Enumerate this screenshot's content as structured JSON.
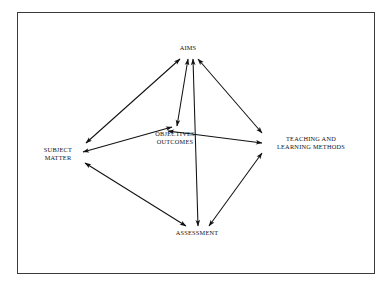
{
  "figure": {
    "type": "relationship-diagram",
    "frame": {
      "border_color": "#3b3b3f",
      "background": "#ffffff"
    },
    "line_color": "#111114"
  },
  "nodes": [
    {
      "id": "aims",
      "label": "AIMS",
      "x": 188,
      "y": 48
    },
    {
      "id": "subject",
      "label": "SUBJECT\nMATTER",
      "x": 58,
      "y": 154
    },
    {
      "id": "objectives",
      "label": "OBJECTIVES\nOUTCOMES",
      "x": 175,
      "y": 138
    },
    {
      "id": "teaching",
      "label": "TEACHING AND\nLEARNING METHODS",
      "x": 311,
      "y": 143
    },
    {
      "id": "assessment",
      "label": "ASSESSMENT",
      "x": 197,
      "y": 233
    }
  ],
  "edges": [
    {
      "id": "aims-subject",
      "from": "aims",
      "to": "subject",
      "direction": "both"
    },
    {
      "id": "aims-teaching",
      "from": "aims",
      "to": "teaching",
      "direction": "both"
    },
    {
      "id": "aims-objectives",
      "from": "aims",
      "to": "objectives",
      "direction": "both"
    },
    {
      "id": "aims-assessment",
      "from": "aims",
      "to": "assessment",
      "direction": "both"
    },
    {
      "id": "subject-objectives",
      "from": "subject",
      "to": "objectives",
      "direction": "both"
    },
    {
      "id": "subject-assessment",
      "from": "subject",
      "to": "assessment",
      "direction": "both"
    },
    {
      "id": "objectives-teaching",
      "from": "objectives",
      "to": "teaching",
      "direction": "both"
    },
    {
      "id": "teaching-assessment",
      "from": "teaching",
      "to": "assessment",
      "direction": "both"
    }
  ],
  "edge_geometry": {
    "aims-subject": {
      "x1": 180,
      "y1": 59,
      "x2": 86,
      "y2": 143
    },
    "aims-teaching": {
      "x1": 198,
      "y1": 59,
      "x2": 262,
      "y2": 133
    },
    "aims-objectives": {
      "x1": 188,
      "y1": 59,
      "x2": 177,
      "y2": 126
    },
    "aims-assessment": {
      "x1": 193,
      "y1": 59,
      "x2": 198,
      "y2": 226
    },
    "subject-objectives": {
      "x1": 83,
      "y1": 152,
      "x2": 172,
      "y2": 127
    },
    "subject-assessment": {
      "x1": 85,
      "y1": 163,
      "x2": 186,
      "y2": 226
    },
    "objectives-teaching": {
      "x1": 168,
      "y1": 131,
      "x2": 262,
      "y2": 143
    },
    "teaching-assessment": {
      "x1": 262,
      "y1": 153,
      "x2": 209,
      "y2": 226
    }
  }
}
